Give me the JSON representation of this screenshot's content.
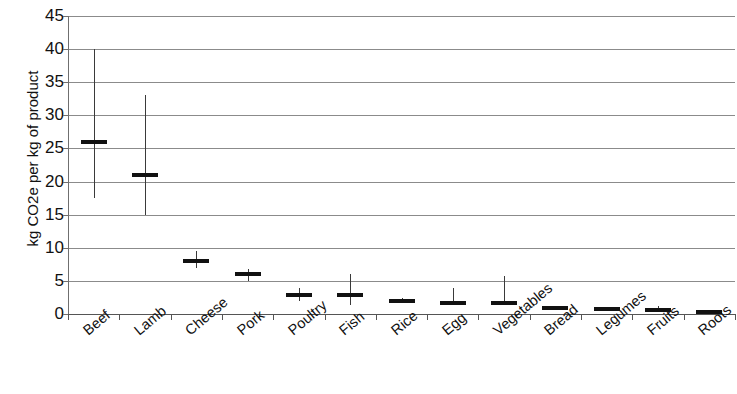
{
  "chart_data": {
    "type": "bar",
    "title": "",
    "subtitle": "",
    "xlabel": "",
    "ylabel": "kg CO2e per kg of product",
    "ylim": [
      0,
      45
    ],
    "ytick_values": [
      0,
      5,
      10,
      15,
      20,
      25,
      30,
      35,
      40,
      45
    ],
    "ytick_labels": [
      "0",
      "5",
      "10",
      "15",
      "20",
      "25",
      "30",
      "35",
      "40",
      "45"
    ],
    "grid": true,
    "legend": "none",
    "marker_style": "horizontal-dash-with-vertical-range-line",
    "categories": [
      "Beef",
      "Lamb",
      "Cheese",
      "Pork",
      "Poultry",
      "Fish",
      "Rice",
      "Egg",
      "Vegetables",
      "Bread",
      "Legumes",
      "Fruits",
      "Roots"
    ],
    "values": [
      26.0,
      21.0,
      8.0,
      6.0,
      2.8,
      2.9,
      2.0,
      1.6,
      1.6,
      0.9,
      0.8,
      0.6,
      0.35
    ],
    "range_low": [
      17.5,
      15.0,
      7.0,
      5.0,
      2.0,
      1.3,
      1.6,
      1.4,
      1.3,
      0.7,
      0.6,
      0.3,
      0.2
    ],
    "range_high": [
      40.0,
      33.0,
      9.5,
      6.8,
      4.0,
      6.0,
      2.4,
      4.0,
      5.7,
      1.1,
      1.1,
      1.2,
      0.5
    ],
    "series": [
      {
        "name": "kg CO2e per kg of product",
        "values": [
          26.0,
          21.0,
          8.0,
          6.0,
          2.8,
          2.9,
          2.0,
          1.6,
          1.6,
          0.9,
          0.8,
          0.6,
          0.35
        ],
        "range_low": [
          17.5,
          15.0,
          7.0,
          5.0,
          2.0,
          1.3,
          1.6,
          1.4,
          1.3,
          0.7,
          0.6,
          0.3,
          0.2
        ],
        "range_high": [
          40.0,
          33.0,
          9.5,
          6.8,
          4.0,
          6.0,
          2.4,
          4.0,
          5.7,
          1.1,
          1.1,
          1.2,
          0.5
        ]
      }
    ],
    "colors": {
      "marker": "#111111",
      "range_line": "#3a3a3a",
      "grid": "#8b8b8b",
      "axis": "#555555",
      "background": "#ffffff"
    }
  }
}
